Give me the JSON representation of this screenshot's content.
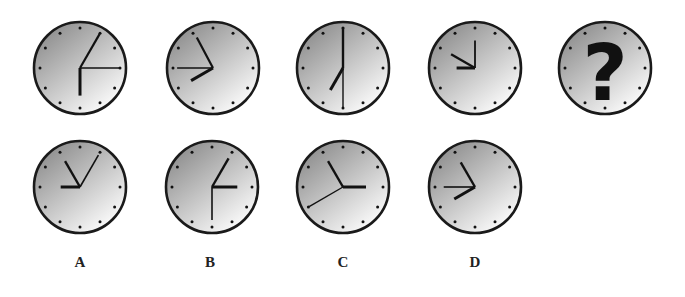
{
  "puzzle": {
    "type": "clock-sequence",
    "question_mark": "?",
    "sequence": [
      {
        "id": "t1",
        "hands": [
          {
            "angle": 30,
            "len": 0.85,
            "w": 2.2
          },
          {
            "angle": 90,
            "len": 0.85,
            "w": 1.6
          },
          {
            "angle": 180,
            "len": 0.6,
            "w": 3
          }
        ]
      },
      {
        "id": "t2",
        "hands": [
          {
            "angle": 332,
            "len": 0.75,
            "w": 2.2
          },
          {
            "angle": 270,
            "len": 0.78,
            "w": 1.6
          },
          {
            "angle": 240,
            "len": 0.55,
            "w": 3
          }
        ]
      },
      {
        "id": "t3",
        "hands": [
          {
            "angle": 0,
            "len": 0.88,
            "w": 2.4
          },
          {
            "angle": 180,
            "len": 0.85,
            "w": 1.4
          },
          {
            "angle": 210,
            "len": 0.55,
            "w": 3
          }
        ]
      },
      {
        "id": "t4",
        "hands": [
          {
            "angle": 0,
            "len": 0.6,
            "w": 1.8
          },
          {
            "angle": 300,
            "len": 0.6,
            "w": 2.4
          },
          {
            "angle": 270,
            "len": 0.4,
            "w": 3
          }
        ]
      },
      {
        "id": "t5",
        "unknown": true
      }
    ],
    "options": [
      {
        "label": "A",
        "hands": [
          {
            "angle": 330,
            "len": 0.65,
            "w": 2.4
          },
          {
            "angle": 30,
            "len": 0.8,
            "w": 1.6
          },
          {
            "angle": 270,
            "len": 0.42,
            "w": 3
          }
        ]
      },
      {
        "label": "B",
        "hands": [
          {
            "angle": 30,
            "len": 0.72,
            "w": 2.4
          },
          {
            "angle": 90,
            "len": 0.55,
            "w": 3
          },
          {
            "angle": 180,
            "len": 0.72,
            "w": 1.6
          }
        ]
      },
      {
        "label": "C",
        "hands": [
          {
            "angle": 330,
            "len": 0.65,
            "w": 2.4
          },
          {
            "angle": 90,
            "len": 0.5,
            "w": 3
          },
          {
            "angle": 240,
            "len": 0.85,
            "w": 1.4
          }
        ]
      },
      {
        "label": "D",
        "hands": [
          {
            "angle": 330,
            "len": 0.62,
            "w": 2.4
          },
          {
            "angle": 270,
            "len": 0.68,
            "w": 1.6
          },
          {
            "angle": 240,
            "len": 0.52,
            "w": 3
          }
        ]
      }
    ]
  },
  "labels": {
    "a": "A",
    "b": "B",
    "c": "C",
    "d": "D"
  },
  "colors": {
    "rim": "#1a1a1a",
    "face_light": "#ffffff",
    "face_dark": "#8c8c8c",
    "hand": "#111111"
  }
}
